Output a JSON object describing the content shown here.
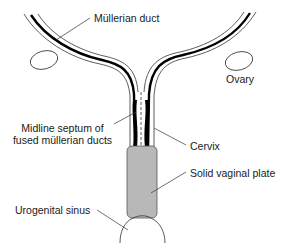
{
  "diagram": {
    "type": "anatomical",
    "labels": {
      "mullerian_duct": "Müllerian duct",
      "ovary": "Ovary",
      "midline_septum_line1": "Midline septum of",
      "midline_septum_line2": "fused müllerian ducts",
      "cervix": "Cervix",
      "solid_vaginal_plate": "Solid vaginal plate",
      "urogenital_sinus": "Urogenital sinus"
    },
    "colors": {
      "outline": "#333333",
      "lumen": "#000000",
      "vaginal_plate_fill": "#b8b8b8",
      "background": "#ffffff"
    }
  }
}
